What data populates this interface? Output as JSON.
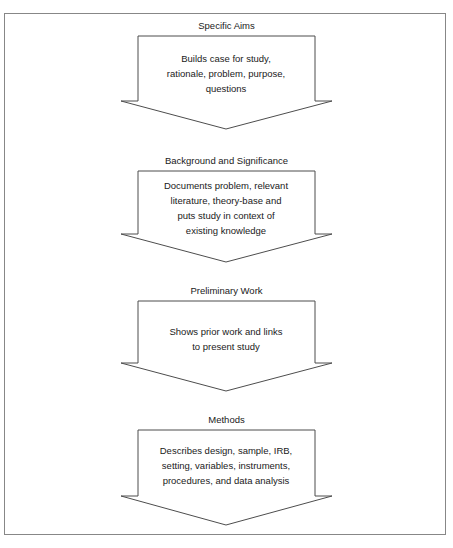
{
  "figure": {
    "orientation": "vertical-top-down",
    "stage_count": 4,
    "line_color": "#4d4d4d",
    "frame_color": "#878787",
    "fill_color": "#ffffff",
    "text_color": "#1a1a1a"
  },
  "stages": [
    {
      "label": "Specific Aims",
      "lines": [
        "Builds case for study,",
        "rationale, problem, purpose,",
        "questions"
      ]
    },
    {
      "label": "Background and Significance",
      "lines": [
        "Documents problem, relevant",
        "literature, theory-base and",
        "puts study in context of",
        "existing knowledge"
      ]
    },
    {
      "label": "Preliminary Work",
      "lines": [
        "Shows prior work and links",
        "to present study"
      ]
    },
    {
      "label": "Methods",
      "lines": [
        "Describes design, sample, IRB,",
        "setting, variables, instruments,",
        "procedures, and data analysis"
      ]
    }
  ]
}
